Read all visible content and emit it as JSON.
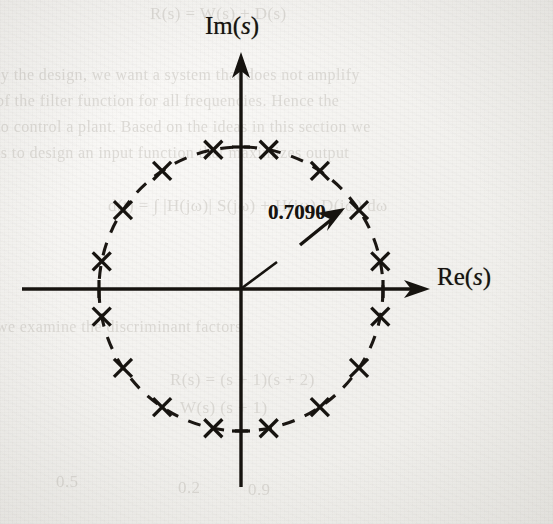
{
  "figure": {
    "kind": "pole-zero-plot",
    "plane_label": "complex s-plane",
    "axes": {
      "imaginary_label_prefix": "Im(",
      "imaginary_label_var": "s",
      "imaginary_label_suffix": ")",
      "real_label_prefix": "Re(",
      "real_label_var": "s",
      "real_label_suffix": ")"
    },
    "annotation": {
      "value_text": "0.7090",
      "points_to": "circle-radius"
    }
  },
  "chart_data": {
    "type": "scatter",
    "title": "",
    "subtitle": "",
    "xlabel": "Re(s)",
    "ylabel": "Im(s)",
    "xlim": [
      -1.45,
      1.45
    ],
    "ylim": [
      -1.45,
      1.45
    ],
    "grid": false,
    "legend": null,
    "marker": "x",
    "annotations": [
      {
        "text": "0.7090",
        "meaning": "radius of the dashed circle on which the poles lie",
        "arrow_from_x": 0.46,
        "arrow_from_y": 0.3,
        "arrow_to_x": 0.62,
        "arrow_to_y": 0.5
      }
    ],
    "reference_curve": {
      "name": "pole circle",
      "shape": "circle",
      "center": [
        0,
        0
      ],
      "radius": 0.709,
      "linestyle": "dashed"
    },
    "axis_ticks": {
      "x": [
        -0.709,
        0.709
      ],
      "y": [
        -0.709,
        0.709
      ],
      "tick_labels_shown": false
    },
    "series": [
      {
        "name": "poles",
        "count": 16,
        "radius": 0.709,
        "angles_deg": [
          11.25,
          33.75,
          56.25,
          78.75,
          101.25,
          123.75,
          146.25,
          168.75,
          191.25,
          213.75,
          236.25,
          258.75,
          281.25,
          303.75,
          326.25,
          348.75
        ],
        "x": [
          0.6954,
          0.5894,
          0.3938,
          0.1383,
          -0.1383,
          -0.3938,
          -0.5894,
          -0.6954,
          -0.6954,
          -0.5894,
          -0.3938,
          -0.1383,
          0.1383,
          0.3938,
          0.5894,
          0.6954
        ],
        "y": [
          0.1383,
          0.3938,
          0.5894,
          0.6954,
          0.6954,
          0.5894,
          0.3938,
          0.1383,
          -0.1383,
          -0.3938,
          -0.5894,
          -0.6954,
          -0.6954,
          -0.5894,
          -0.3938,
          -0.1383
        ]
      }
    ]
  },
  "bleed_through": {
    "lines": [
      {
        "text": "R(s)  =  W(s) + D(s)",
        "x": 150,
        "y": 4,
        "size": 17
      },
      {
        "text": "ly the design, we want a system that does not amplify",
        "x": -4,
        "y": 66,
        "size": 16
      },
      {
        "text": "of the filter function for all frequencies. Hence the",
        "x": -4,
        "y": 92,
        "size": 16
      },
      {
        "text": "to control a plant.  Based on the ideas in this section we",
        "x": -4,
        "y": 118,
        "size": 16
      },
      {
        "text": "is to design an input function that maximizes output",
        "x": -4,
        "y": 144,
        "size": 16
      },
      {
        "text": "d(t) = ∫  |H(jω)| S(jω) + H(jω) D(jω)  dω",
        "x": 108,
        "y": 196,
        "size": 17
      },
      {
        "text": "we examine the discriminant factors",
        "x": -4,
        "y": 318,
        "size": 16
      },
      {
        "text": "R(s) = (s + 1)(s + 2)",
        "x": 170,
        "y": 370,
        "size": 17
      },
      {
        "text": "W(s)        (s + 1)",
        "x": 180,
        "y": 398,
        "size": 17
      },
      {
        "text": "0.9",
        "x": 248,
        "y": 480,
        "size": 17
      },
      {
        "text": "0.2",
        "x": 178,
        "y": 478,
        "size": 17
      },
      {
        "text": "0.5",
        "x": 56,
        "y": 472,
        "size": 17
      }
    ]
  }
}
